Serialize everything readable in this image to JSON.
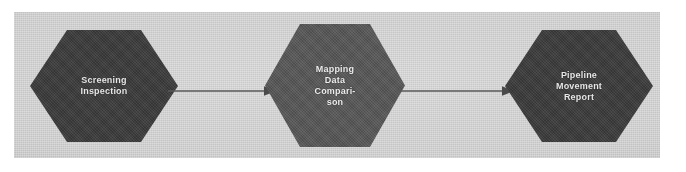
{
  "diagram": {
    "type": "process-flow",
    "orientation": "left-to-right",
    "node_shape": "hexagon",
    "background_color": "#cfcfcf",
    "canvas_color": "#ffffff",
    "nodes": [
      {
        "id": "screening-inspection",
        "label": "Screening\nInspection",
        "lines": [
          "Screening",
          "Inspection"
        ],
        "fill_color": "#3a3a3a",
        "text_color": "#e8e8e8"
      },
      {
        "id": "mapping-data-comparison",
        "label": "Mapping\nData\nCompari-\nson",
        "lines": [
          "Mapping",
          "Data",
          "Compari-",
          "son"
        ],
        "fill_color": "#565656",
        "text_color": "#efefef"
      },
      {
        "id": "pipeline-movement-report",
        "label": "Pipeline\nMovement\nReport",
        "lines": [
          "Pipeline",
          "Movement",
          "Report"
        ],
        "fill_color": "#3a3a3a",
        "text_color": "#e8e8e8"
      }
    ],
    "connectors": [
      {
        "id": "connector-1",
        "from": "screening-inspection",
        "to": "mapping-data-comparison",
        "style": "single-arrow",
        "color": "#5a5a5a"
      },
      {
        "id": "connector-2",
        "from": "mapping-data-comparison",
        "to": "pipeline-movement-report",
        "style": "single-arrow",
        "color": "#5a5a5a"
      }
    ]
  }
}
